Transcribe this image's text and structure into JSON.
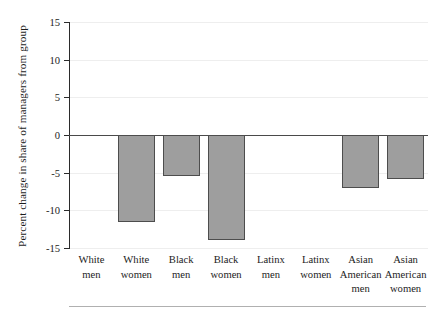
{
  "chart_data": {
    "type": "bar",
    "title": "",
    "subtitle": "",
    "xlabel": "",
    "ylabel": "Percent change in share of managers from group",
    "categories": [
      "White men",
      "White women",
      "Black men",
      "Black women",
      "Latinx men",
      "Latinx women",
      "Asian American men",
      "Asian American women"
    ],
    "category_lines": [
      [
        "White",
        "men"
      ],
      [
        "White",
        "women"
      ],
      [
        "Black",
        "men"
      ],
      [
        "Black",
        "women"
      ],
      [
        "Latinx",
        "men"
      ],
      [
        "Latinx",
        "women"
      ],
      [
        "Asian",
        "American",
        "men"
      ],
      [
        "Asian",
        "American",
        "women"
      ]
    ],
    "values": [
      0,
      -11.5,
      -5.4,
      -14.0,
      0,
      0,
      -7.0,
      -5.9
    ],
    "ylim": [
      -15,
      15
    ],
    "yticks": [
      15,
      10,
      5,
      0,
      -5,
      -10,
      -15
    ],
    "ytick_labels": [
      "15",
      "10",
      "5",
      "0",
      "-5",
      "-10",
      "-15"
    ],
    "grid": true,
    "legend": "none",
    "bar_fill_color": "#9e9e9e",
    "bar_edge_color": "#4d4d4d",
    "axis_color": "#2b2b2b",
    "zero_line_color": "#4a4a4a",
    "grid_color": "#eeeeee",
    "text_color": "#1c1c1c"
  }
}
